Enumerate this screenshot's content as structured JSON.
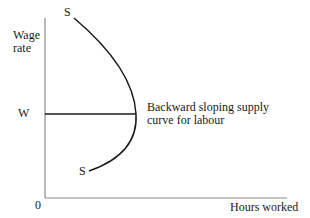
{
  "diagram": {
    "type": "economics-supply-curve",
    "title": "Backward sloping supply curve for labour",
    "axes": {
      "y_label_line1": "Wage",
      "y_label_line2": "rate",
      "x_label": "Hours worked",
      "origin_label": "0"
    },
    "wage_level": {
      "label": "W"
    },
    "curve": {
      "name": "S",
      "top_label": "S",
      "bottom_label": "S",
      "annotation_line1": "Backward sloping supply",
      "annotation_line2": "curve for labour"
    },
    "colors": {
      "axis": "#8a8a8a",
      "curve": "#1a1a1a",
      "text": "#1a1a1a"
    }
  }
}
